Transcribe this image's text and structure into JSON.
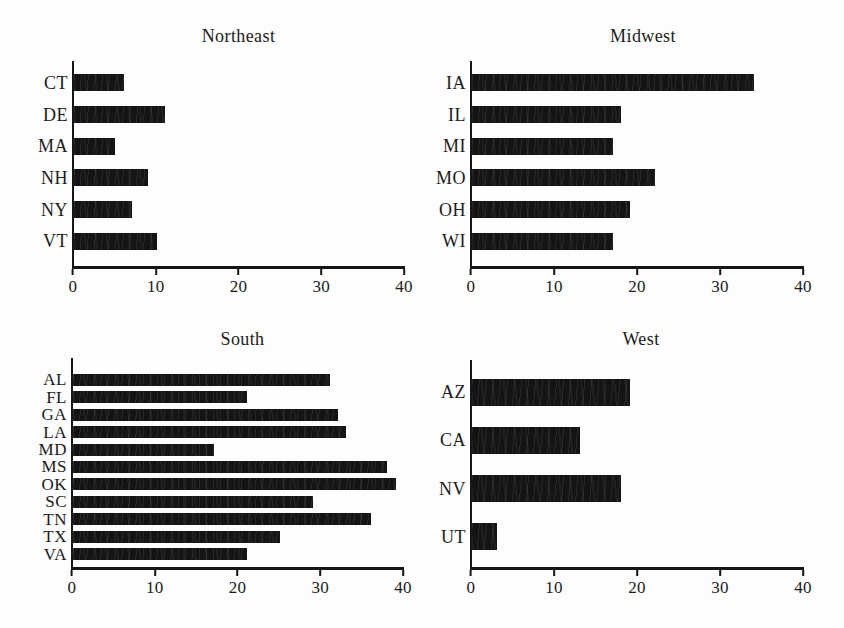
{
  "colors": {
    "bar": "#141414",
    "axis": "#161616",
    "text": "#1b1b1b",
    "paper": "#fdfdfd"
  },
  "chart_data": [
    {
      "type": "bar",
      "orientation": "horizontal",
      "title": "Northeast",
      "categories": [
        "CT",
        "DE",
        "MA",
        "NH",
        "NY",
        "VT"
      ],
      "values": [
        6,
        11,
        5,
        9,
        7,
        10
      ],
      "xlabel": "",
      "ylabel": "",
      "xlim": [
        0,
        40
      ],
      "xticks": [
        0,
        10,
        20,
        30,
        40
      ],
      "grid": false,
      "legend": false
    },
    {
      "type": "bar",
      "orientation": "horizontal",
      "title": "Midwest",
      "categories": [
        "IA",
        "IL",
        "MI",
        "MO",
        "OH",
        "WI"
      ],
      "values": [
        34,
        18,
        17,
        22,
        19,
        17
      ],
      "xlabel": "",
      "ylabel": "",
      "xlim": [
        0,
        40
      ],
      "xticks": [
        0,
        10,
        20,
        30,
        40
      ],
      "grid": false,
      "legend": false
    },
    {
      "type": "bar",
      "orientation": "horizontal",
      "title": "South",
      "categories": [
        "AL",
        "FL",
        "GA",
        "LA",
        "MD",
        "MS",
        "OK",
        "SC",
        "TN",
        "TX",
        "VA"
      ],
      "values": [
        31,
        21,
        32,
        33,
        17,
        38,
        39,
        29,
        36,
        25,
        21
      ],
      "xlabel": "",
      "ylabel": "",
      "xlim": [
        0,
        40
      ],
      "xticks": [
        0,
        10,
        20,
        30,
        40
      ],
      "grid": false,
      "legend": false
    },
    {
      "type": "bar",
      "orientation": "horizontal",
      "title": "West",
      "categories": [
        "AZ",
        "CA",
        "NV",
        "UT"
      ],
      "values": [
        19,
        13,
        18,
        3
      ],
      "xlabel": "",
      "ylabel": "",
      "xlim": [
        0,
        40
      ],
      "xticks": [
        0,
        10,
        20,
        30,
        40
      ],
      "grid": false,
      "legend": false
    }
  ]
}
